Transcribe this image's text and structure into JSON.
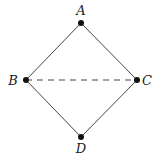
{
  "diagram": {
    "nodes": [
      {
        "id": "A",
        "label": "A"
      },
      {
        "id": "B",
        "label": "B"
      },
      {
        "id": "C",
        "label": "C"
      },
      {
        "id": "D",
        "label": "D"
      }
    ],
    "edges": [
      {
        "from": "A",
        "to": "B",
        "style": "solid"
      },
      {
        "from": "A",
        "to": "C",
        "style": "solid"
      },
      {
        "from": "B",
        "to": "D",
        "style": "solid"
      },
      {
        "from": "C",
        "to": "D",
        "style": "solid"
      },
      {
        "from": "B",
        "to": "C",
        "style": "dashed"
      }
    ],
    "colors": {
      "line": "#444444",
      "node": "#111111"
    }
  }
}
